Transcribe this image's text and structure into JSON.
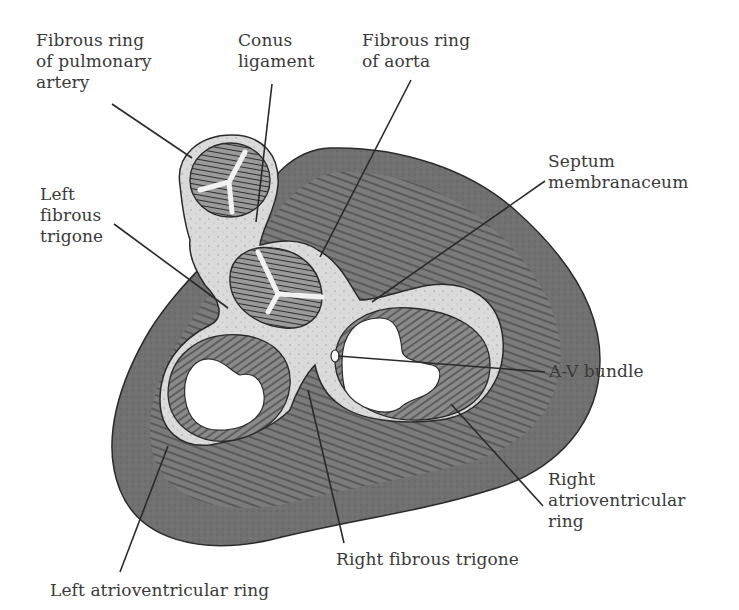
{
  "figure": {
    "colors": {
      "outer_myocardium": "#6e6e6e",
      "myocardium_hatch": "#4a4a4a",
      "fibrous_tissue": "#d9d9d9",
      "valve_leaflet": "#8a8a8a",
      "line": "#2a2a2a",
      "text": "#3a3a3a",
      "background": "#ffffff"
    }
  },
  "labels": {
    "pulmonary_ring": "Fibrous ring\nof pulmonary\nartery",
    "conus_ligament": "Conus\nligament",
    "aortic_ring": "Fibrous ring\nof aorta",
    "septum_membranaceum": "Septum\nmembranaceum",
    "left_fibrous_trigone": "Left\nfibrous\ntrigone",
    "av_bundle": "A-V bundle",
    "right_av_ring": "Right\natrioventricular\nring",
    "right_fibrous_trigone": "Right fibrous trigone",
    "left_av_ring": "Left atrioventricular ring"
  }
}
